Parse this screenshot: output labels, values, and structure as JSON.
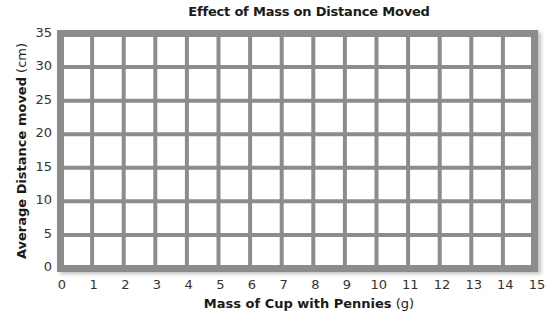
{
  "chart_data": {
    "type": "line",
    "title": "Effect of Mass on Distance Moved",
    "xlabel": "Mass of Cup with Pennies",
    "xlabel_unit": "(g)",
    "ylabel": "Average Distance moved",
    "ylabel_unit": "(cm)",
    "x_ticks": [
      "0",
      "1",
      "2",
      "3",
      "4",
      "5",
      "6",
      "7",
      "8",
      "9",
      "10",
      "11",
      "12",
      "13",
      "14",
      "15"
    ],
    "y_ticks": [
      "0",
      "5",
      "10",
      "15",
      "20",
      "25",
      "30",
      "35"
    ],
    "xlim": [
      0,
      15
    ],
    "ylim": [
      0,
      35
    ],
    "grid": true,
    "grid_color": "#8c8c8c",
    "series": [],
    "note": "Blank graph grid with no plotted data"
  }
}
